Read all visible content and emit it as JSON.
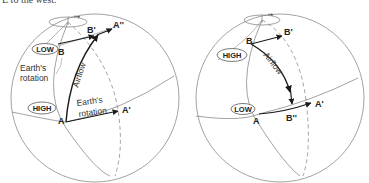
{
  "caption": "E to the west.",
  "colors": {
    "outline": "#8a8a8a",
    "arrow": "#1a1a1a",
    "text": "#222222"
  },
  "left_globe": {
    "rotation_icon": "rotation-arrow-icon",
    "pressure_low": "LOW",
    "pressure_high": "HIGH",
    "point_b": "B",
    "point_b_prime": "B'",
    "point_a_double_prime": "A''",
    "point_a": "A",
    "point_a_prime": "A'",
    "label_earth_rotation_upper": [
      "Earth's",
      "rotation"
    ],
    "label_airflow": "Airflow",
    "label_earth_rotation_lower": [
      "Earth's",
      "rotation"
    ]
  },
  "right_globe": {
    "rotation_icon": "rotation-arrow-icon",
    "pressure_high": "HIGH",
    "pressure_low": "LOW",
    "point_b": "B",
    "point_b_prime": "B'",
    "label_airflow": "Airflow",
    "point_a": "A",
    "point_b_double_prime": "B''",
    "point_a_prime": "A'"
  }
}
